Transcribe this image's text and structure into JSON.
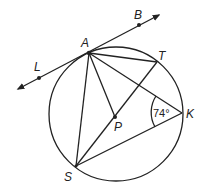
{
  "diagram": {
    "type": "circle-geometry",
    "circle": {
      "center_label": "P",
      "cx": 116,
      "cy": 114,
      "r": 67
    },
    "points": {
      "A": {
        "label": "A",
        "x": 89,
        "y": 53
      },
      "B": {
        "label": "B",
        "x": 139,
        "y": 25
      },
      "L": {
        "label": "L",
        "x": 39,
        "y": 78
      },
      "T": {
        "label": "T",
        "x": 157,
        "y": 62
      },
      "K": {
        "label": "K",
        "x": 182,
        "y": 113
      },
      "P": {
        "label": "P",
        "x": 115,
        "y": 117
      },
      "S": {
        "label": "S",
        "x": 76,
        "y": 166
      }
    },
    "tangent_line": {
      "through": [
        "L",
        "A",
        "B"
      ],
      "arrows": "both"
    },
    "segments": [
      "AT",
      "AK",
      "AP",
      "AS",
      "TS",
      "SK"
    ],
    "angle": {
      "vertex": "K",
      "between": [
        "A",
        "S"
      ],
      "label": "74°"
    }
  }
}
